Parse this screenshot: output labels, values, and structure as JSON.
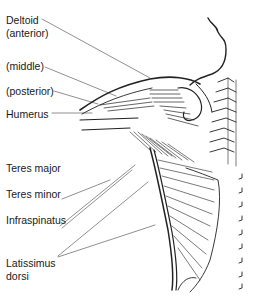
{
  "figure": {
    "labels": [
      {
        "id": "deltoid",
        "line1": "Deltoid",
        "line2": "(anterior)"
      },
      {
        "id": "middle",
        "line1": "(middle)"
      },
      {
        "id": "posterior",
        "line1": "(posterior)"
      },
      {
        "id": "humerus",
        "line1": "Humerus"
      },
      {
        "id": "teres-major",
        "line1": "Teres major"
      },
      {
        "id": "teres-minor",
        "line1": "Teres minor"
      },
      {
        "id": "infraspinatus",
        "line1": "Infraspinatus"
      },
      {
        "id": "latissimus",
        "line1": "Latissimus",
        "line2": "dorsi"
      }
    ]
  }
}
